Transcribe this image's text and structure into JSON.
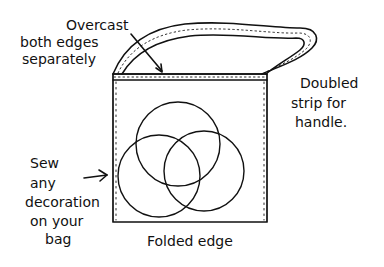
{
  "diagram": {
    "labels": {
      "overcast": [
        "Overcast",
        "both edges",
        "separately"
      ],
      "handle": [
        "Doubled",
        "strip for",
        "handle."
      ],
      "decoration": [
        "Sew",
        "any",
        "decoration",
        "on your",
        "bag"
      ],
      "folded_edge": "Folded edge"
    },
    "colors": {
      "ink": "#111111",
      "paper": "#ffffff"
    }
  }
}
